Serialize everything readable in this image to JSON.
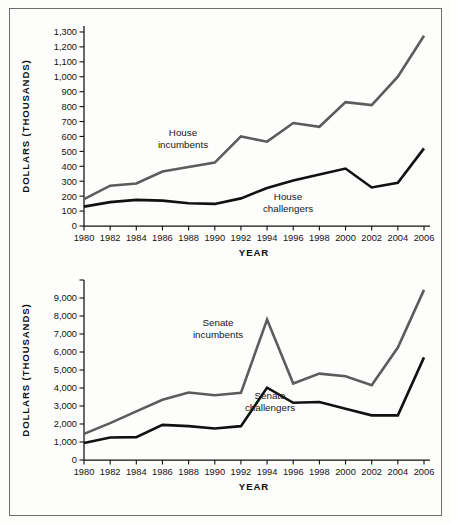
{
  "figure": {
    "background": "#fdfdfc",
    "frame_color": "#6e6e6e"
  },
  "colors": {
    "incumbents": "#5c5c5c",
    "challengers": "#111111",
    "axis": "#111111",
    "text": "#121212"
  },
  "panels": {
    "house": {
      "name": "house-chart",
      "ylabel": "DOLLARS (THOUSANDS)",
      "xlabel": "YEAR",
      "annotations": [
        {
          "text_line1": "House",
          "text_line2": "incumbents"
        },
        {
          "text_line1": "House",
          "text_line2": "challengers"
        }
      ]
    },
    "senate": {
      "name": "senate-chart",
      "ylabel": "DOLLARS (THOUSANDS)",
      "xlabel": "YEAR",
      "annotations": [
        {
          "text_line1": "Senate",
          "text_line2": "incumbents"
        },
        {
          "text_line1": "Senate",
          "text_line2": "challengers"
        }
      ]
    }
  },
  "chart_data": [
    {
      "type": "line",
      "id": "house",
      "title": "House campaign spending",
      "xlabel": "YEAR",
      "ylabel": "DOLLARS (THOUSANDS)",
      "x": [
        1980,
        1982,
        1984,
        1986,
        1988,
        1990,
        1992,
        1994,
        1996,
        1998,
        2000,
        2002,
        2004,
        2006
      ],
      "xticklabels": [
        "1980",
        "1982",
        "1984",
        "1986",
        "1988",
        "1990",
        "1992",
        "1994",
        "1996",
        "1998",
        "2000",
        "2002",
        "2004",
        "2006"
      ],
      "yticks": [
        0,
        100,
        200,
        300,
        400,
        500,
        600,
        700,
        800,
        900,
        1000,
        1100,
        1200,
        1300
      ],
      "yticklabels": [
        "0",
        "100",
        "200",
        "300",
        "400",
        "500",
        "600",
        "700",
        "800",
        "900",
        "1,000",
        "1,100",
        "1,200",
        "1,300"
      ],
      "ylim": [
        0,
        1340
      ],
      "xlim": [
        1980,
        2006
      ],
      "grid": false,
      "legend_position": "inline-annotations",
      "series": [
        {
          "name": "House incumbents",
          "color": "#5c5c5c",
          "width": 2.6,
          "values": [
            180,
            270,
            285,
            365,
            395,
            425,
            600,
            565,
            690,
            665,
            830,
            810,
            1000,
            1275
          ]
        },
        {
          "name": "House challengers",
          "color": "#111111",
          "width": 2.6,
          "values": [
            130,
            160,
            175,
            170,
            152,
            148,
            185,
            255,
            305,
            345,
            385,
            258,
            290,
            520
          ]
        }
      ]
    },
    {
      "type": "line",
      "id": "senate",
      "title": "Senate campaign spending",
      "xlabel": "YEAR",
      "ylabel": "DOLLARS (THOUSANDS)",
      "x": [
        1980,
        1982,
        1984,
        1986,
        1988,
        1990,
        1992,
        1994,
        1996,
        1998,
        2000,
        2002,
        2004,
        2006
      ],
      "xticklabels": [
        "1980",
        "1982",
        "1984",
        "1986",
        "1988",
        "1990",
        "1992",
        "1994",
        "1996",
        "1998",
        "2000",
        "2002",
        "2004",
        "2006"
      ],
      "yticks": [
        0,
        1000,
        2000,
        3000,
        4000,
        5000,
        6000,
        7000,
        8000,
        9000,
        10000
      ],
      "yticklabels": [
        "0",
        "1,000",
        "2,000",
        "3,000",
        "4,000",
        "5,000",
        "6,000",
        "7,000",
        "8,000",
        "9,000",
        ""
      ],
      "ylim": [
        0,
        10000
      ],
      "xlim": [
        1980,
        2006
      ],
      "grid": false,
      "legend_position": "inline-annotations",
      "series": [
        {
          "name": "Senate incumbents",
          "color": "#5c5c5c",
          "width": 2.6,
          "values": [
            1450,
            2050,
            2700,
            3350,
            3750,
            3600,
            3730,
            7800,
            4250,
            4800,
            4650,
            4150,
            6250,
            9450
          ]
        },
        {
          "name": "Senate challengers",
          "color": "#111111",
          "width": 2.6,
          "values": [
            950,
            1250,
            1270,
            1950,
            1880,
            1750,
            1880,
            4020,
            3180,
            3220,
            2850,
            2480,
            2480,
            5700
          ]
        }
      ]
    }
  ]
}
